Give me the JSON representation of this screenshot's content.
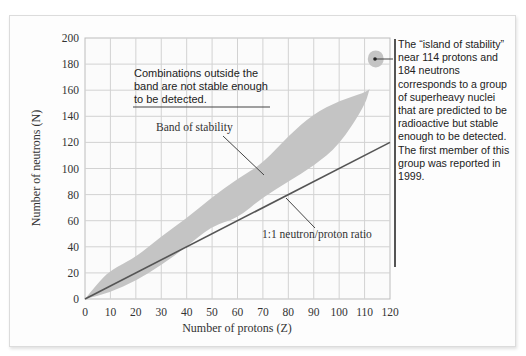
{
  "chart_data": {
    "type": "area",
    "title": "",
    "xlabel": "Number of protons (Z)",
    "ylabel": "Number of neutrons (N)",
    "xlim": [
      0,
      120
    ],
    "ylim": [
      0,
      200
    ],
    "x_ticks": [
      "0",
      "10",
      "20",
      "30",
      "40",
      "50",
      "60",
      "70",
      "80",
      "90",
      "100",
      "110",
      "120"
    ],
    "y_ticks": [
      "0",
      "20",
      "40",
      "60",
      "80",
      "100",
      "120",
      "140",
      "160",
      "180",
      "200"
    ],
    "grid": true,
    "series": [
      {
        "name": "Band of stability",
        "kind": "band",
        "color": "#c4c4c4",
        "upper": [
          [
            0,
            0
          ],
          [
            5,
            12
          ],
          [
            10,
            22
          ],
          [
            20,
            32
          ],
          [
            30,
            48
          ],
          [
            40,
            62
          ],
          [
            50,
            78
          ],
          [
            60,
            92
          ],
          [
            70,
            104
          ],
          [
            80,
            125
          ],
          [
            90,
            142
          ],
          [
            100,
            152
          ],
          [
            110,
            158
          ],
          [
            112,
            161
          ]
        ],
        "lower": [
          [
            0,
            0
          ],
          [
            10,
            5
          ],
          [
            20,
            14
          ],
          [
            30,
            26
          ],
          [
            40,
            40
          ],
          [
            50,
            56
          ],
          [
            60,
            62
          ],
          [
            70,
            78
          ],
          [
            80,
            90
          ],
          [
            90,
            102
          ],
          [
            100,
            118
          ],
          [
            110,
            148
          ],
          [
            112,
            161
          ]
        ]
      },
      {
        "name": "1:1 neutron/proton ratio",
        "kind": "line",
        "color": "#555555",
        "points": [
          [
            0,
            0
          ],
          [
            120,
            120
          ]
        ]
      },
      {
        "name": "Island of stability",
        "kind": "point",
        "color": "#c4c4c4",
        "x": 114,
        "y": 184
      }
    ],
    "annotations": [
      {
        "text": "Combinations outside the band are not stable enough to be detected.",
        "position": "upper-left"
      },
      {
        "text": "Band of stability",
        "target": [
          70,
          102
        ]
      },
      {
        "text": "1:1 neutron/proton ratio",
        "target": [
          78,
          78
        ]
      },
      {
        "text": "The “island of stability” near 114 protons and 184 neutrons corresponds to a group of superheavy nuclei that are predicted to be radioactive but stable enough to be detected. The first member of this group was reported in 1999.",
        "target": [
          114,
          184
        ]
      }
    ]
  },
  "labels": {
    "outside_line1": "Combinations outside the",
    "outside_line2": "band are not stable enough",
    "outside_line3": "to be detected.",
    "band": "Band of stability",
    "ratio": "1:1 neutron/proton ratio",
    "xlabel": "Number of protons (Z)",
    "ylabel": "Number of neutrons (N)",
    "sidenote": "The “island of stability” near 114 protons and 184 neutrons corresponds to a group of superheavy nuclei that are predicted to be radioactive but stable enough to be detected. The first member of this group was reported in 1999."
  }
}
